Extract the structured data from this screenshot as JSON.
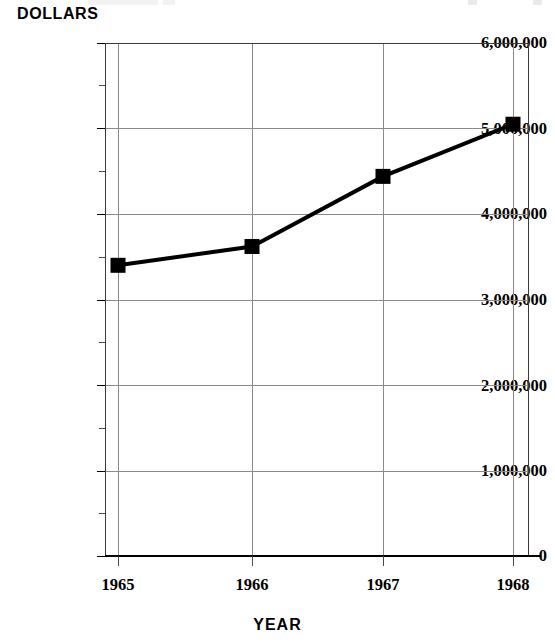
{
  "chart_data": {
    "type": "line",
    "title": "",
    "xlabel": "YEAR",
    "ylabel": "DOLLARS",
    "categories": [
      "1965",
      "1966",
      "1967",
      "1968"
    ],
    "x": [
      1965,
      1966,
      1967,
      1968
    ],
    "values": [
      3400000,
      3620000,
      4440000,
      5050000
    ],
    "series": [
      {
        "name": "Dollars",
        "values": [
          3400000,
          3620000,
          4440000,
          5050000
        ]
      }
    ],
    "ylim": [
      0,
      6000000
    ],
    "ytick_labels": [
      "0",
      "1,000,000",
      "2,000,000",
      "3,000,000",
      "4,000,000",
      "5,000,000",
      "6,000,000"
    ],
    "ytick_values": [
      0,
      1000000,
      2000000,
      3000000,
      4000000,
      5000000,
      6000000
    ],
    "yminor_interval": 500000,
    "xtick_labels": [
      "1965",
      "1966",
      "1967",
      "1968"
    ],
    "grid": "both",
    "legend": "none",
    "marker": "square",
    "line_color": "#000000",
    "marker_color": "#000000",
    "grid_color": "#8a8a8a",
    "axis_color": "#000000",
    "background": "#ffffff"
  },
  "axes": {
    "y_title": "DOLLARS",
    "x_title": "YEAR"
  },
  "y_ticks": [
    {
      "label": "6,000,000",
      "value": 6000000
    },
    {
      "label": "5,000,000",
      "value": 5000000
    },
    {
      "label": "4,000,000",
      "value": 4000000
    },
    {
      "label": "3,000,000",
      "value": 3000000
    },
    {
      "label": "2,000,000",
      "value": 2000000
    },
    {
      "label": "1,000,000",
      "value": 1000000
    },
    {
      "label": "0",
      "value": 0
    }
  ],
  "x_ticks": [
    {
      "label": "1965",
      "value": 1965
    },
    {
      "label": "1966",
      "value": 1966
    },
    {
      "label": "1967",
      "value": 1967
    },
    {
      "label": "1968",
      "value": 1968
    }
  ],
  "points": [
    {
      "year": "1965",
      "value": "3,400,000"
    },
    {
      "year": "1966",
      "value": "3,620,000"
    },
    {
      "year": "1967",
      "value": "4,440,000"
    },
    {
      "year": "1968",
      "value": "5,050,000"
    }
  ]
}
